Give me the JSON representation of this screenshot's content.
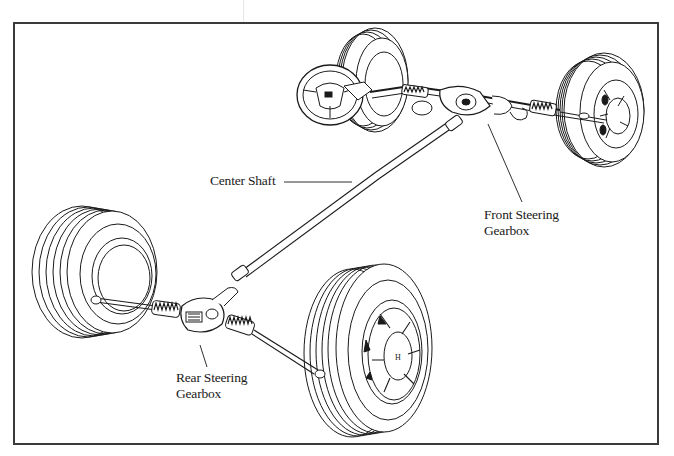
{
  "diagram": {
    "labels": {
      "center_shaft": "Center Shaft",
      "front_gearbox_line1": "Front Steering",
      "front_gearbox_line2": "Gearbox",
      "rear_gearbox_line1": "Rear Steering",
      "rear_gearbox_line2": "Gearbox"
    },
    "components": [
      {
        "name": "steering-wheel",
        "labeled": false
      },
      {
        "name": "front-left-wheel",
        "labeled": false
      },
      {
        "name": "front-right-wheel",
        "labeled": false
      },
      {
        "name": "front-steering-gearbox",
        "labeled": true
      },
      {
        "name": "center-shaft",
        "labeled": true
      },
      {
        "name": "rear-steering-gearbox",
        "labeled": true
      },
      {
        "name": "rear-left-wheel",
        "labeled": false
      },
      {
        "name": "rear-right-wheel",
        "labeled": false
      }
    ],
    "hub_emblem": "H",
    "colors": {
      "line": "#1a1a1a",
      "background": "#ffffff",
      "frame": "#3a3a3a"
    }
  }
}
